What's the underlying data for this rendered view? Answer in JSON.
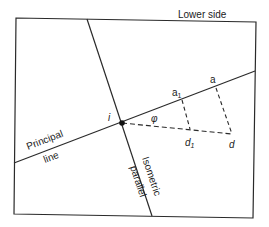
{
  "diagram": {
    "labels": {
      "lower_side": "Lower side",
      "principal_word": "Principal",
      "line_word": "line",
      "isometric_word": "Isometric",
      "parallel_word": "parallel",
      "point_i": "i",
      "angle_phi": "φ",
      "point_a1_base": "a",
      "point_a1_sub": "1",
      "point_a": "a",
      "point_d1_base": "d",
      "point_d1_sub": "1",
      "point_d": "d"
    },
    "colors": {
      "line": "#2a2a2a",
      "background": "#ffffff"
    }
  }
}
